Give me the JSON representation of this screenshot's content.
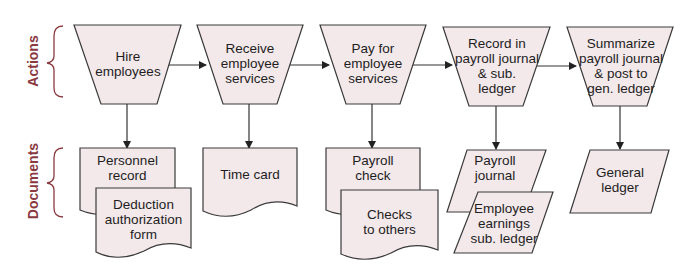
{
  "colors": {
    "shape_fill": "#f3e8ea",
    "stroke": "#3a3a3a",
    "side_label": "#8a3a3f"
  },
  "rows": {
    "actions_label": "Actions",
    "documents_label": "Documents"
  },
  "actions": [
    {
      "id": "hire",
      "lines": [
        "Hire",
        "employees"
      ]
    },
    {
      "id": "receive",
      "lines": [
        "Receive",
        "employee",
        "services"
      ]
    },
    {
      "id": "pay",
      "lines": [
        "Pay for",
        "employee",
        "services"
      ]
    },
    {
      "id": "record",
      "lines": [
        "Record in",
        "payroll journal",
        "& sub.",
        "ledger"
      ]
    },
    {
      "id": "summarize",
      "lines": [
        "Summarize",
        "payroll journal",
        "& post to",
        "gen. ledger"
      ]
    }
  ],
  "documents": [
    {
      "id": "personnel-record",
      "shape": "document",
      "lines": [
        "Personnel",
        "record"
      ]
    },
    {
      "id": "deduction-form",
      "shape": "document",
      "lines": [
        "Deduction",
        "authorization",
        "form"
      ]
    },
    {
      "id": "time-card",
      "shape": "document",
      "lines": [
        "Time card"
      ]
    },
    {
      "id": "payroll-check",
      "shape": "document",
      "lines": [
        "Payroll",
        "check"
      ]
    },
    {
      "id": "checks-to-others",
      "shape": "document",
      "lines": [
        "Checks",
        "to others"
      ]
    },
    {
      "id": "payroll-journal",
      "shape": "parallelogram",
      "lines": [
        "Payroll",
        "journal"
      ]
    },
    {
      "id": "employee-earnings",
      "shape": "parallelogram",
      "lines": [
        "Employee",
        "earnings",
        "sub. ledger"
      ]
    },
    {
      "id": "general-ledger",
      "shape": "parallelogram",
      "lines": [
        "General",
        "ledger"
      ]
    }
  ],
  "text": {
    "a0": "Hire\nemployees",
    "a1": "Receive\nemployee\nservices",
    "a2": "Pay for\nemployee\nservices",
    "a3": "Record in\npayroll journal\n& sub.\nledger",
    "a4": "Summarize\npayroll journal\n& post to\ngen. ledger",
    "d0": "Personnel\nrecord",
    "d1": "Deduction\nauthorization\nform",
    "d2": "Time card",
    "d3": "Payroll\ncheck",
    "d4": "Checks\nto others",
    "d5": "Payroll\njournal",
    "d6": "Employee\nearnings\nsub. ledger",
    "d7": "General\nledger"
  }
}
